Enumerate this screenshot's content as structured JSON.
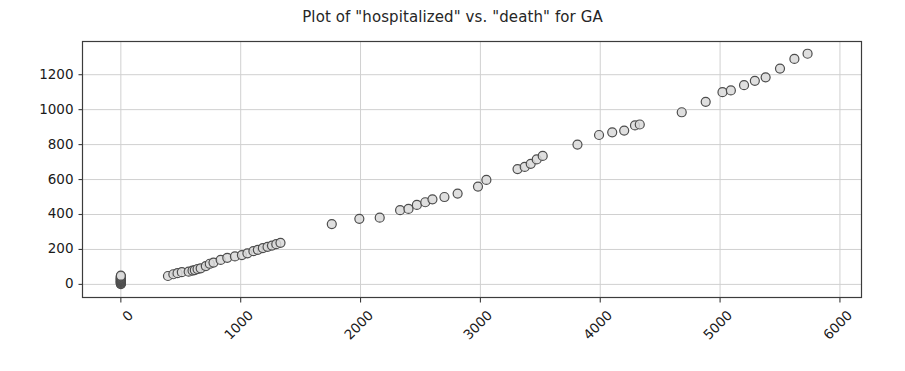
{
  "chart_data": {
    "type": "scatter",
    "title": "Plot of \"hospitalized\" vs. \"death\" for GA",
    "xlabel": "",
    "ylabel": "",
    "xlim": [
      -320,
      6180
    ],
    "ylim": [
      -75,
      1390
    ],
    "xticks": [
      0,
      1000,
      2000,
      3000,
      4000,
      5000,
      6000
    ],
    "yticks": [
      0,
      200,
      400,
      600,
      800,
      1000,
      1200
    ],
    "xticklabels": [
      "0",
      "1000",
      "2000",
      "3000",
      "4000",
      "5000",
      "6000"
    ],
    "yticklabels": [
      "0",
      "200",
      "400",
      "600",
      "800",
      "1000",
      "1200"
    ],
    "xtick_rotation": -45,
    "grid": true,
    "grid_color": "#d0d0d0",
    "legend": null,
    "marker": {
      "shape": "circle",
      "face_color": "#d9d9d9",
      "edge_color": "#4d4d4d",
      "size": 9,
      "alpha": 0.85
    },
    "series": [
      {
        "name": "GA",
        "x": [
          0,
          0,
          0,
          0,
          0,
          0,
          0,
          0,
          0,
          0,
          0,
          0,
          0,
          0,
          0,
          0,
          0,
          0,
          0,
          0,
          0,
          393,
          438,
          473,
          509,
          566,
          598,
          617,
          640,
          666,
          709,
          742,
          773,
          833,
          888,
          952,
          1010,
          1056,
          1106,
          1143,
          1185,
          1224,
          1261,
          1297,
          1332,
          1760,
          1990,
          2160,
          2330,
          2400,
          2470,
          2540,
          2600,
          2700,
          2810,
          2980,
          3050,
          3310,
          3370,
          3420,
          3470,
          3520,
          3810,
          3990,
          4100,
          4200,
          4290,
          4330,
          4680,
          4880,
          5020,
          5090,
          5200,
          5290,
          5380,
          5500,
          5620,
          5730
        ],
        "y": [
          2,
          5,
          8,
          10,
          12,
          14,
          16,
          18,
          20,
          22,
          25,
          27,
          29,
          31,
          33,
          35,
          38,
          40,
          43,
          46,
          50,
          48,
          58,
          64,
          70,
          73,
          79,
          82,
          88,
          92,
          105,
          118,
          125,
          140,
          152,
          160,
          168,
          178,
          190,
          198,
          208,
          215,
          222,
          230,
          238,
          345,
          375,
          382,
          425,
          432,
          455,
          470,
          487,
          500,
          520,
          560,
          598,
          660,
          672,
          690,
          715,
          735,
          800,
          855,
          870,
          880,
          910,
          915,
          985,
          1045,
          1100,
          1110,
          1140,
          1165,
          1185,
          1235,
          1290,
          1320
        ]
      }
    ]
  }
}
